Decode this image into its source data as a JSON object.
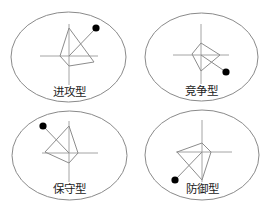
{
  "diagram": {
    "type": "radar-style strategy type diagrams",
    "panels": [
      {
        "label": "进攻型",
        "ellipse": {
          "cx": 68.5,
          "cy": 57,
          "rx": 57.5,
          "ry": 45
        },
        "center": [
          69,
          56
        ],
        "axes": {
          "v": [
            69,
            24,
            69,
            93
          ],
          "h": [
            40,
            56,
            98,
            56
          ]
        },
        "polygon": [
          [
            69,
            28
          ],
          [
            94,
            62
          ],
          [
            69,
            66
          ],
          [
            60,
            56
          ]
        ],
        "dot": [
          96,
          28
        ],
        "label_pos": [
          69,
          96
        ]
      },
      {
        "label": "竞争型",
        "ellipse": {
          "cx": 201.5,
          "cy": 57,
          "rx": 56.5,
          "ry": 44
        },
        "center": [
          201,
          55
        ],
        "axes": {
          "v": [
            201,
            24,
            201,
            95
          ],
          "h": [
            173,
            55,
            229,
            55
          ]
        },
        "polygon": [
          [
            201,
            43
          ],
          [
            220,
            55
          ],
          [
            201,
            71
          ],
          [
            192,
            54
          ]
        ],
        "dot": [
          226,
          72
        ],
        "label_pos": [
          201,
          95
        ]
      },
      {
        "label": "保守型",
        "ellipse": {
          "cx": 69.5,
          "cy": 155.5,
          "rx": 57.5,
          "ry": 44.5
        },
        "center": [
          69,
          153
        ],
        "axes": {
          "v": [
            69,
            121,
            69,
            190
          ],
          "h": [
            42,
            153,
            98,
            153
          ]
        },
        "polygon": [
          [
            69,
            126
          ],
          [
            78,
            153
          ],
          [
            69,
            163
          ],
          [
            45,
            152
          ]
        ],
        "dot": [
          43,
          126
        ],
        "label_pos": [
          69,
          193
        ]
      },
      {
        "label": "防御型",
        "ellipse": {
          "cx": 202,
          "cy": 155,
          "rx": 57,
          "ry": 45
        },
        "center": [
          202,
          152
        ],
        "axes": {
          "v": [
            202,
            120,
            202,
            190
          ],
          "h": [
            176,
            152,
            232,
            152
          ]
        },
        "polygon": [
          [
            202,
            143
          ],
          [
            211,
            152
          ],
          [
            202,
            180
          ],
          [
            177,
            152
          ]
        ],
        "dot": [
          175,
          180
        ],
        "label_pos": [
          202,
          193
        ]
      }
    ]
  },
  "labels": {
    "p0": "进攻型",
    "p1": "竞争型",
    "p2": "保守型",
    "p3": "防御型"
  },
  "colors": {
    "outline": "#8a8a8a",
    "dot": "#000000",
    "text": "#222222",
    "background": "#ffffff"
  }
}
